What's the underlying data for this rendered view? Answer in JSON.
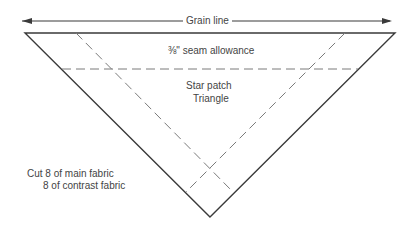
{
  "diagram": {
    "grain_line_label": "Grain line",
    "seam_allowance_label": "⅜\" seam allowance",
    "piece_name_line1": "Star patch",
    "piece_name_line2": "Triangle",
    "cut_instruction_line1": "Cut 8 of main fabric",
    "cut_instruction_line2": "8 of contrast fabric",
    "colors": {
      "outline": "#3a3a3a",
      "dashed": "#7a7a7a",
      "background": "#ffffff"
    }
  }
}
